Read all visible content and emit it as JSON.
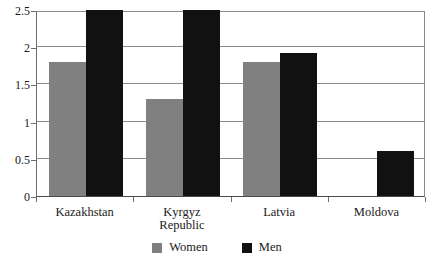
{
  "chart_data": {
    "type": "bar",
    "title": "",
    "xlabel": "",
    "ylabel": "",
    "ylim": [
      0,
      2.5
    ],
    "yticks": [
      "0",
      "0.5",
      "1",
      "1.5",
      "2",
      "2.5"
    ],
    "ytick_values": [
      0,
      0.5,
      1,
      1.5,
      2,
      2.5
    ],
    "grid": true,
    "legend_position": "bottom-center",
    "categories": [
      "Kazakhstan",
      "Kyrgyz Republic",
      "Latvia",
      "Moldova"
    ],
    "category_lines": [
      [
        "Kazakhstan"
      ],
      [
        "Kyrgyz",
        "Republic"
      ],
      [
        "Latvia"
      ],
      [
        "Moldova"
      ]
    ],
    "series": [
      {
        "name": "Women",
        "color": "#808080",
        "values": [
          1.8,
          1.3,
          1.8,
          null
        ]
      },
      {
        "name": "Men",
        "color": "#111111",
        "values": [
          2.54,
          2.5,
          1.92,
          0.6
        ]
      }
    ]
  },
  "legend": {
    "items": [
      {
        "label": "Women",
        "color": "#808080"
      },
      {
        "label": "Men",
        "color": "#111111"
      }
    ]
  },
  "axes": {
    "axis_color": "#6e6e6e",
    "gridline_color": "#8a8a8a"
  }
}
